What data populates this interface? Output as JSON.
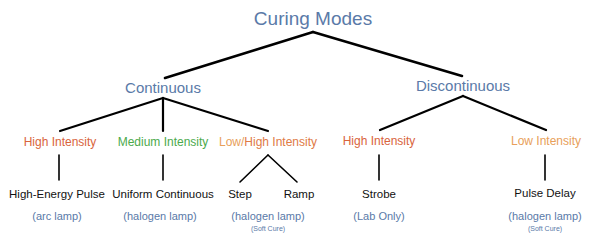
{
  "title": "Curing Modes",
  "colors": {
    "mode": "#5a7aa8",
    "high_intensity": "#d9643c",
    "medium_intensity": "#4caa4c",
    "low_intensity": "#e8a05a",
    "technique": "#111111",
    "source": "#5a7aa8",
    "edge": "#000000"
  },
  "modes": [
    {
      "label": "Continuous",
      "intensities": [
        {
          "label": "High Intensity",
          "techniques": [
            {
              "label": "High-Energy Pulse"
            }
          ],
          "source": "(arc lamp)",
          "note": ""
        },
        {
          "label": "Medium Intensity",
          "techniques": [
            {
              "label": "Uniform Continuous"
            }
          ],
          "source": "(halogen lamp)",
          "note": ""
        },
        {
          "label_low": "Low/",
          "label_high": "High Intensity",
          "techniques": [
            {
              "label": "Step"
            },
            {
              "label": "Ramp"
            }
          ],
          "source": "(halogen lamp)",
          "note": "(Soft Cure)"
        }
      ]
    },
    {
      "label": "Discontinuous",
      "intensities": [
        {
          "label": "High Intensity",
          "techniques": [
            {
              "label": "Strobe"
            }
          ],
          "source": "(Lab Only)",
          "note": ""
        },
        {
          "label": "Low Intensity",
          "techniques": [
            {
              "label": "Pulse Delay"
            }
          ],
          "source": "(halogen lamp)",
          "note": "(Soft Cure)"
        }
      ]
    }
  ]
}
